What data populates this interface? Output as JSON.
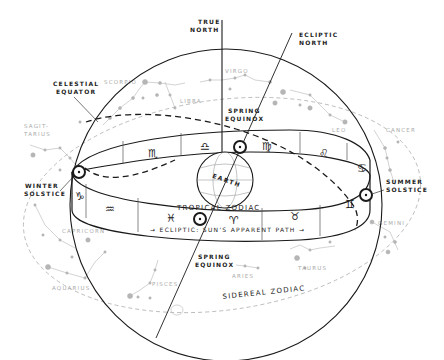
{
  "diagram": {
    "labels": {
      "true_north": [
        "TRUE",
        "NORTH"
      ],
      "ecliptic_north": [
        "ECLIPTIC",
        "NORTH"
      ],
      "celestial_equator": [
        "CELESTIAL",
        "EQUATOR"
      ],
      "spring_equinox_top": [
        "SPRING",
        "EQUINOX"
      ],
      "spring_equinox_bottom": [
        "SPRING",
        "EQUINOX"
      ],
      "winter_solstice": [
        "WINTER",
        "SOLSTICE"
      ],
      "summer_solstice": [
        "SUMMER",
        "SOLSTICE"
      ],
      "earth": "EARTH",
      "tropical_zodiac": "TROPICAL ZODIAC",
      "ecliptic_path": "→ ECLIPTIC: SUN'S APPARENT PATH →",
      "sidereal_zodiac": "SIDEREAL ZODIAC"
    },
    "constellations": [
      {
        "name": "SCORPIO"
      },
      {
        "name": "LIBRA"
      },
      {
        "name": "VIRGO"
      },
      {
        "name": "LEO"
      },
      {
        "name": "CANCER"
      },
      {
        "name": "GEMINI"
      },
      {
        "name": "TAURUS"
      },
      {
        "name": "ARIES"
      },
      {
        "name": "PISCES"
      },
      {
        "name": "AQUARIUS"
      },
      {
        "name": "CAPRICORN"
      },
      {
        "name": "SAGIT-TARIUS"
      }
    ],
    "zodiac_signs_back": [
      "♏",
      "♎",
      "♍",
      "♌",
      "♋"
    ],
    "zodiac_signs_front": [
      "♑",
      "♒",
      "♓",
      "♈",
      "♉",
      "♊"
    ],
    "sun_symbol": "☉",
    "colors": {
      "line": "#1a1a1a",
      "constellation": "#a8a8a8",
      "background": "#ffffff"
    }
  }
}
